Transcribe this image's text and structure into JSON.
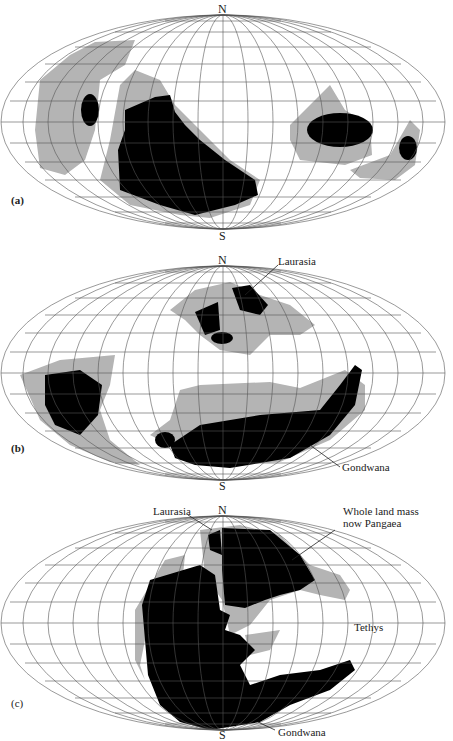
{
  "figure": {
    "panels": [
      {
        "id": "a",
        "tag": "(a)",
        "pole_north": "N",
        "pole_south": "S",
        "annotations": []
      },
      {
        "id": "b",
        "tag": "(b)",
        "pole_north": "N",
        "pole_south": "S",
        "annotations": [
          {
            "text": "Laurasia"
          },
          {
            "text": "Gondwana"
          }
        ]
      },
      {
        "id": "c",
        "tag": "(c)",
        "pole_north": "N",
        "pole_south": "S",
        "annotations": [
          {
            "text": "Laurasia"
          },
          {
            "text": "Whole land mass"
          },
          {
            "text": "now Pangaea"
          },
          {
            "text": "Tethys"
          },
          {
            "text": "Gondwana"
          }
        ]
      }
    ],
    "colors": {
      "grid": "#555555",
      "continental_shelf": "#b4b4b4",
      "land": "#000000",
      "background": "#ffffff"
    }
  }
}
